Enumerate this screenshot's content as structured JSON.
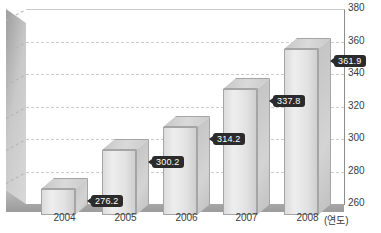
{
  "chart_data": {
    "type": "bar",
    "title": "",
    "xlabel": "(연도)",
    "ylabel": "",
    "categories": [
      "2004",
      "2005",
      "2006",
      "2007",
      "2008"
    ],
    "values": [
      276.2,
      300.2,
      314.2,
      337.8,
      361.9
    ],
    "data_labels": [
      "276.2",
      "300.2",
      "314.2",
      "337.8",
      "361.9"
    ],
    "ylim": [
      260,
      380
    ],
    "ytick_labels": [
      "260",
      "280",
      "300",
      "320",
      "340",
      "360",
      "380"
    ],
    "ytick_values": [
      260,
      280,
      300,
      320,
      340,
      360,
      380
    ],
    "grid": true,
    "grid_style": "dashed",
    "legend": "none",
    "axis_position": "right",
    "style_3d": true,
    "colors": {
      "bar_face": "#e2e2e2",
      "bar_side": "#c8c8c8",
      "bar_top": "#d2d2d2",
      "bar_outline": "#a5a5a5",
      "wall": "#c2c2c2",
      "floor": "#a8a8a8",
      "gridline": "#cccccc",
      "label_background": "#2b2b2b",
      "label_text": "#ffffff",
      "axis_text": "#3b3b3b",
      "background": "#ffffff"
    }
  }
}
